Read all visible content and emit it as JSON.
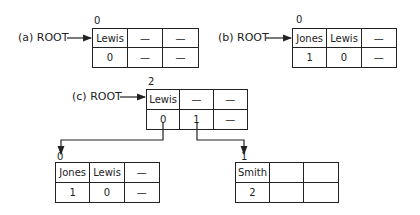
{
  "diagrams": {
    "a": {
      "label": "(a) ROOT",
      "index": "0",
      "cells": [
        "Lewis",
        "—",
        "—",
        "0",
        "—",
        "—"
      ]
    },
    "b": {
      "label": "(b) ROOT",
      "index": "0",
      "cells": [
        "Jones",
        "Lewis",
        "—",
        "1",
        "0",
        "—"
      ]
    },
    "c": {
      "label": "(c) ROOT",
      "index": "2",
      "cells": [
        "Lewis",
        "—",
        "—",
        "0",
        "1",
        "—"
      ],
      "left_child": {
        "index": "0",
        "cells": [
          "Jones",
          "Lewis",
          "—",
          "1",
          "0",
          "—"
        ]
      },
      "right_child": {
        "index": "1",
        "cells": [
          "Smith",
          "",
          "",
          "2",
          "",
          ""
        ]
      }
    }
  }
}
